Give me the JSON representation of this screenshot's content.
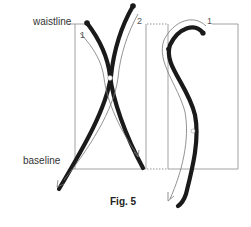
{
  "figure": {
    "caption": "Fig. 5",
    "labels": {
      "waistline": "waistline",
      "baseline": "baseline"
    },
    "stroke_numbers": {
      "x_left_stroke": "1",
      "x_right_stroke": "2",
      "s_stroke": "1"
    },
    "colors": {
      "stroke": "#1a1a1a",
      "guide": "#888888",
      "arrow": "#777777"
    },
    "letters": [
      "X",
      "S"
    ]
  }
}
